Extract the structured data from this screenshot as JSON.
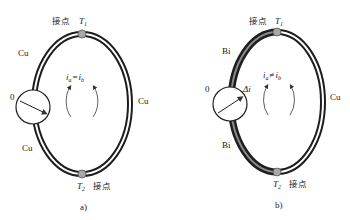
{
  "diagrams": [
    {
      "id": "a",
      "caption": "a)",
      "top_junction": {
        "label": "接点",
        "symbol": "T",
        "subscript": "1"
      },
      "bottom_junction": {
        "label": "接点",
        "symbol": "T",
        "subscript": "2"
      },
      "wires": {
        "left_upper": "Cu",
        "left_lower": "Cu",
        "right": "Cu"
      },
      "meter": {
        "zero_label": "0",
        "deflection_label": ""
      },
      "current_relation": {
        "left": "i",
        "left_sub": "a",
        "op": "=",
        "right": "i",
        "right_sub": "b"
      }
    },
    {
      "id": "b",
      "caption": "b)",
      "top_junction": {
        "label": "接点",
        "symbol": "T",
        "subscript": "1"
      },
      "bottom_junction": {
        "label": "接点",
        "symbol": "T",
        "subscript": "2"
      },
      "wires": {
        "left_upper": "Bi",
        "left_lower": "Bi",
        "right": "Cu"
      },
      "meter": {
        "zero_label": "0",
        "deflection_label": "Δi"
      },
      "current_relation": {
        "left": "i",
        "left_sub": "a",
        "op": "≠",
        "right": "i",
        "right_sub": "b"
      }
    }
  ],
  "colors": {
    "wire_dark": "#1e1e1e",
    "wire_inner_cu": "#ffffff",
    "wire_inner_bi": "#8a8a8a",
    "junction": "#a8a8a8",
    "text": "#222222"
  }
}
